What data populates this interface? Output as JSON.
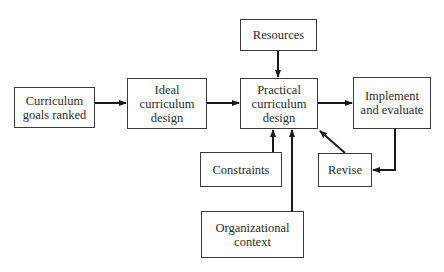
{
  "diagram": {
    "nodes": [
      {
        "id": "goals",
        "label": "Curriculum\ngoals ranked",
        "x": 14,
        "y": 87,
        "w": 81,
        "h": 41
      },
      {
        "id": "ideal",
        "label": "Ideal\ncurriculum\ndesign",
        "x": 127,
        "y": 78,
        "w": 80,
        "h": 51
      },
      {
        "id": "resources",
        "label": "Resources",
        "x": 240,
        "y": 19,
        "w": 77,
        "h": 32
      },
      {
        "id": "practical",
        "label": "Practical\ncurriculum\ndesign",
        "x": 240,
        "y": 78,
        "w": 78,
        "h": 51
      },
      {
        "id": "implement",
        "label": "Implement\nand evaluate",
        "x": 353,
        "y": 77,
        "w": 78,
        "h": 52
      },
      {
        "id": "constraints",
        "label": "Constraints",
        "x": 200,
        "y": 152,
        "w": 82,
        "h": 35
      },
      {
        "id": "revise",
        "label": "Revise",
        "x": 318,
        "y": 153,
        "w": 54,
        "h": 34
      },
      {
        "id": "org",
        "label": "Organizational\ncontext",
        "x": 201,
        "y": 211,
        "w": 103,
        "h": 47
      }
    ],
    "edges": [
      {
        "from": "goals",
        "to": "ideal"
      },
      {
        "from": "ideal",
        "to": "practical"
      },
      {
        "from": "resources",
        "to": "practical"
      },
      {
        "from": "practical",
        "to": "implement"
      },
      {
        "from": "constraints",
        "to": "practical"
      },
      {
        "from": "org",
        "to": "practical"
      },
      {
        "from": "implement",
        "to": "revise"
      },
      {
        "from": "revise",
        "to": "practical"
      }
    ]
  },
  "labels": {
    "goals": "Curriculum\ngoals ranked",
    "ideal": "Ideal\ncurriculum\ndesign",
    "resources": "Resources",
    "practical": "Practical\ncurriculum\ndesign",
    "implement": "Implement\nand evaluate",
    "constraints": "Constraints",
    "revise": "Revise",
    "org": "Organizational\ncontext"
  }
}
